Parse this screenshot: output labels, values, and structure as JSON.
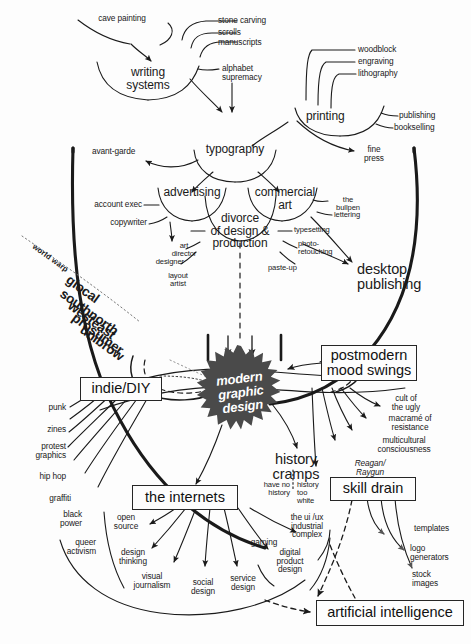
{
  "diagram": {
    "colors": {
      "ink": "#1a1a1a",
      "blob_fill": "#4a4a4a",
      "background": "#fdfdfd",
      "box_border": "#262626"
    },
    "center": {
      "label": "modern\ngraphic\ndesign"
    },
    "nodes": {
      "cave_painting": "cave painting",
      "writing_systems": "writing\nsystems",
      "stone_carving": "stone carving",
      "scrolls": "scrolls",
      "manuscripts": "manuscripts",
      "alphabet_supremacy": "alphabet\nsupremacy",
      "printing": "printing",
      "woodblock": "woodblock",
      "engraving": "engraving",
      "lithography": "lithography",
      "publishing": "publishing",
      "bookselling": "bookselling",
      "typography": "typography",
      "avant_garde": "avant-garde",
      "fine_press": "fine\npress",
      "advertising": "advertising",
      "commercial_art": "commercial\nart",
      "account_exec": "account exec",
      "copywriter": "copywriter",
      "art_director": "art\ndirector",
      "designer": "designer",
      "layout_artist": "layout\nartist",
      "divorce": "divorce\nof design &\nproduction",
      "the_bullpen": "the\nbullpen",
      "lettering": "lettering",
      "typesetting": "typesetting",
      "photo_retouching": "photo-\nretouching",
      "paste_up": "paste-up",
      "desktop_publishing": "desktop\npublishing",
      "indie_diy": "indie/DIY",
      "punk": "punk",
      "zines": "zines",
      "protest_graphics": "protest\ngraphics",
      "hip_hop": "hip hop",
      "graffiti": "graffiti",
      "black_power": "black\npower",
      "queer_activism": "queer\nactivism",
      "the_internets": "the internets",
      "open_source": "open\nsource",
      "design_thinking": "design\nthinking",
      "visual_journalism": "visual\njournalism",
      "social_design": "social\ndesign",
      "service_design": "service\ndesign",
      "digital_product_design": "digital\nproduct\ndesign",
      "gaming": "gaming",
      "ui_ux_industrial_complex": "the ui /ux\nindustrial\ncomplex",
      "history_cramps": "history\ncramps",
      "have_no_history": "have no\nhistory",
      "history_too_white": "history\ntoo\nwhite",
      "postmodern_mood_swings": "postmodern\nmood swings",
      "cult_of_the_ugly": "cult of\nthe ugly",
      "macrame_of_resistance": "macramé of\nresistance",
      "multicultural_consciousness": "multicultural\nconsciousness",
      "reagan_raygun": "Reagan/\nRaygun",
      "skill_drain": "skill drain",
      "templates": "templates",
      "logo_generators": "logo\ngenerators",
      "stock_images": "stock\nimages",
      "artificial_intelligence": "artificial intelligence",
      "world_warp": "world warp",
      "glocal": "glocal",
      "southnorth": "southnorth",
      "westeast": "westeast",
      "prosumer": "prosumer",
      "unibrow": "unibrow"
    }
  }
}
